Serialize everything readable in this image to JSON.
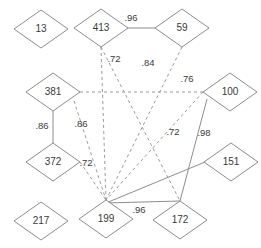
{
  "diagram": {
    "width": 261,
    "height": 248,
    "background_color": "#ffffff",
    "node_fill": "#ffffff",
    "node_stroke": "#8d8d8d",
    "edge_solid_color": "#8d8d8d",
    "edge_dashed_color": "#9a9a9a",
    "label_color": "#3a3a3a",
    "node_shape": "diamond",
    "node_width": 54,
    "node_height": 38
  },
  "nodes": [
    {
      "id": "n13",
      "label": "13",
      "cx": 41,
      "cy": 29
    },
    {
      "id": "n413",
      "label": "413",
      "cx": 101,
      "cy": 28
    },
    {
      "id": "n59",
      "label": "59",
      "cx": 182,
      "cy": 28
    },
    {
      "id": "n381",
      "label": "381",
      "cx": 53,
      "cy": 92
    },
    {
      "id": "n100",
      "label": "100",
      "cx": 230,
      "cy": 92
    },
    {
      "id": "n372",
      "label": "372",
      "cx": 53,
      "cy": 162
    },
    {
      "id": "n151",
      "label": "151",
      "cx": 231,
      "cy": 162
    },
    {
      "id": "n217",
      "label": "217",
      "cx": 41,
      "cy": 221
    },
    {
      "id": "n199",
      "label": "199",
      "cx": 106,
      "cy": 219
    },
    {
      "id": "n172",
      "label": "172",
      "cx": 180,
      "cy": 220
    }
  ],
  "edges": [
    {
      "id": "e413-59",
      "source": "413",
      "target": "59",
      "style": "solid",
      "weight": ".96",
      "x1": 128,
      "y1": 28,
      "x2": 155,
      "y2": 28,
      "lx": 131,
      "ly": 18
    },
    {
      "id": "e413-199",
      "source": "413",
      "target": "199",
      "style": "dashed",
      "weight": ".72",
      "x1": 101,
      "y1": 47,
      "x2": 106,
      "y2": 200,
      "lx": 114,
      "ly": 59
    },
    {
      "id": "e413-172",
      "source": "413",
      "target": "172",
      "style": "dashed",
      "weight": "",
      "x1": 101,
      "y1": 47,
      "x2": 180,
      "y2": 201,
      "lx": 0,
      "ly": 0
    },
    {
      "id": "e59-199",
      "source": "59",
      "target": "199",
      "style": "dashed",
      "weight": ".84",
      "x1": 182,
      "y1": 47,
      "x2": 106,
      "y2": 200,
      "lx": 148,
      "ly": 63
    },
    {
      "id": "e381-100",
      "source": "381",
      "target": "100",
      "style": "dashed",
      "weight": ".76",
      "x1": 80,
      "y1": 92,
      "x2": 203,
      "y2": 92,
      "lx": 187,
      "ly": 79
    },
    {
      "id": "e381-199",
      "source": "381",
      "target": "199",
      "style": "dashed",
      "weight": ".86",
      "x1": 74,
      "y1": 101,
      "x2": 106,
      "y2": 200,
      "lx": 81,
      "ly": 124
    },
    {
      "id": "e381-372",
      "source": "381",
      "target": "372",
      "style": "solid",
      "weight": ".86",
      "x1": 53,
      "y1": 111,
      "x2": 53,
      "y2": 143,
      "lx": 42,
      "ly": 126
    },
    {
      "id": "e372-199",
      "source": "372",
      "target": "199",
      "style": "dashed",
      "weight": ".72",
      "x1": 80,
      "y1": 162,
      "x2": 106,
      "y2": 200,
      "lx": 86,
      "ly": 163
    },
    {
      "id": "e100-199",
      "source": "100",
      "target": "199",
      "style": "dashed",
      "weight": ".72",
      "x1": 203,
      "y1": 92,
      "x2": 106,
      "y2": 200,
      "lx": 173,
      "ly": 132
    },
    {
      "id": "e100-172",
      "source": "100",
      "target": "172",
      "style": "solid",
      "weight": ".98",
      "x1": 207,
      "y1": 99,
      "x2": 180,
      "y2": 201,
      "lx": 204,
      "ly": 133
    },
    {
      "id": "e151-172",
      "source": "151",
      "target": "172",
      "style": "solid",
      "weight": "",
      "x1": 205,
      "y1": 162,
      "x2": 106,
      "y2": 203,
      "lx": 0,
      "ly": 0
    },
    {
      "id": "e199-172",
      "source": "199",
      "target": "172",
      "style": "solid",
      "weight": ".96",
      "x1": 106,
      "y1": 203,
      "x2": 180,
      "y2": 201,
      "lx": 139,
      "ly": 210
    }
  ]
}
